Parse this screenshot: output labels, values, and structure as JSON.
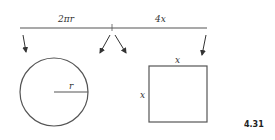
{
  "diagram": {
    "segment": {
      "left_label": "2πr",
      "right_label": "4x"
    },
    "circle": {
      "radius_label": "r"
    },
    "square": {
      "top_label": "x",
      "side_label": "x"
    },
    "figure_number": "4.31",
    "colors": {
      "stroke": "#555555",
      "text": "#333333",
      "background": "#ffffff"
    }
  }
}
